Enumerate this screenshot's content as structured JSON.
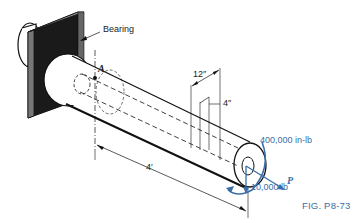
{
  "figure": {
    "caption": "FIG. P8-73",
    "labels": {
      "bearing": "Bearing",
      "point_a": "A",
      "dim_12": "12″",
      "dim_4in": "4″",
      "dim_4ft": "4′",
      "moment": "400,000 in-lb",
      "force_p": "P",
      "force_down": "10,000 lb"
    },
    "colors": {
      "line": "#111111",
      "load": "#3a6ea8",
      "bearing_fill": "#1a1a1a"
    }
  }
}
